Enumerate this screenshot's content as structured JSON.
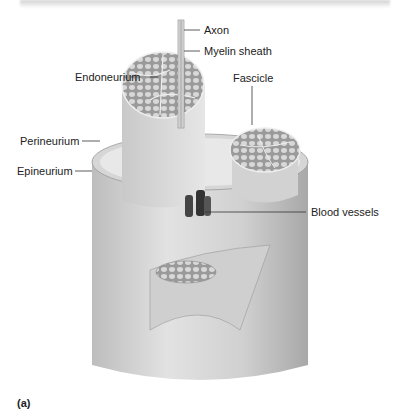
{
  "figure": {
    "panel_label": "(a)",
    "labels": {
      "axon": "Axon",
      "myelin_sheath": "Myelin sheath",
      "endoneurium": "Endoneurium",
      "fascicle": "Fascicle",
      "perineurium": "Perineurium",
      "epineurium": "Epineurium",
      "blood_vessels": "Blood vessels"
    }
  }
}
